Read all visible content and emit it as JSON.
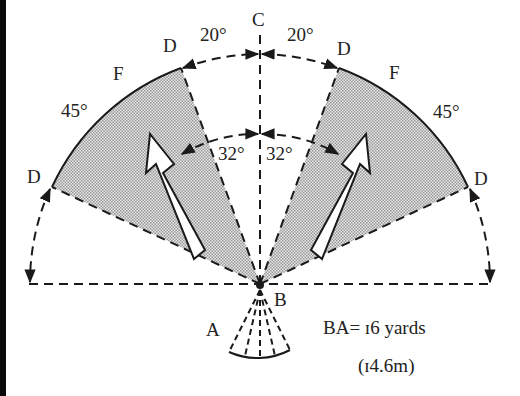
{
  "diagram": {
    "labels": {
      "C": "C",
      "D_inner_left": "D",
      "D_inner_right": "D",
      "D_outer_left": "D",
      "D_outer_right": "D",
      "F_left": "F",
      "F_right": "F",
      "A": "A",
      "B": "B"
    },
    "angles": {
      "top_left": "20°",
      "top_right": "20°",
      "side_left": "45°",
      "side_right": "45°",
      "inner_left": "32°",
      "inner_right": "32°"
    },
    "note": {
      "line1": "BA= ɪ6 yards",
      "line2": "(ɪ4.6m)"
    },
    "colors": {
      "line": "#1a1a1a",
      "shade": "#c8c8c8",
      "left_bar": "#0a0a0a"
    }
  }
}
